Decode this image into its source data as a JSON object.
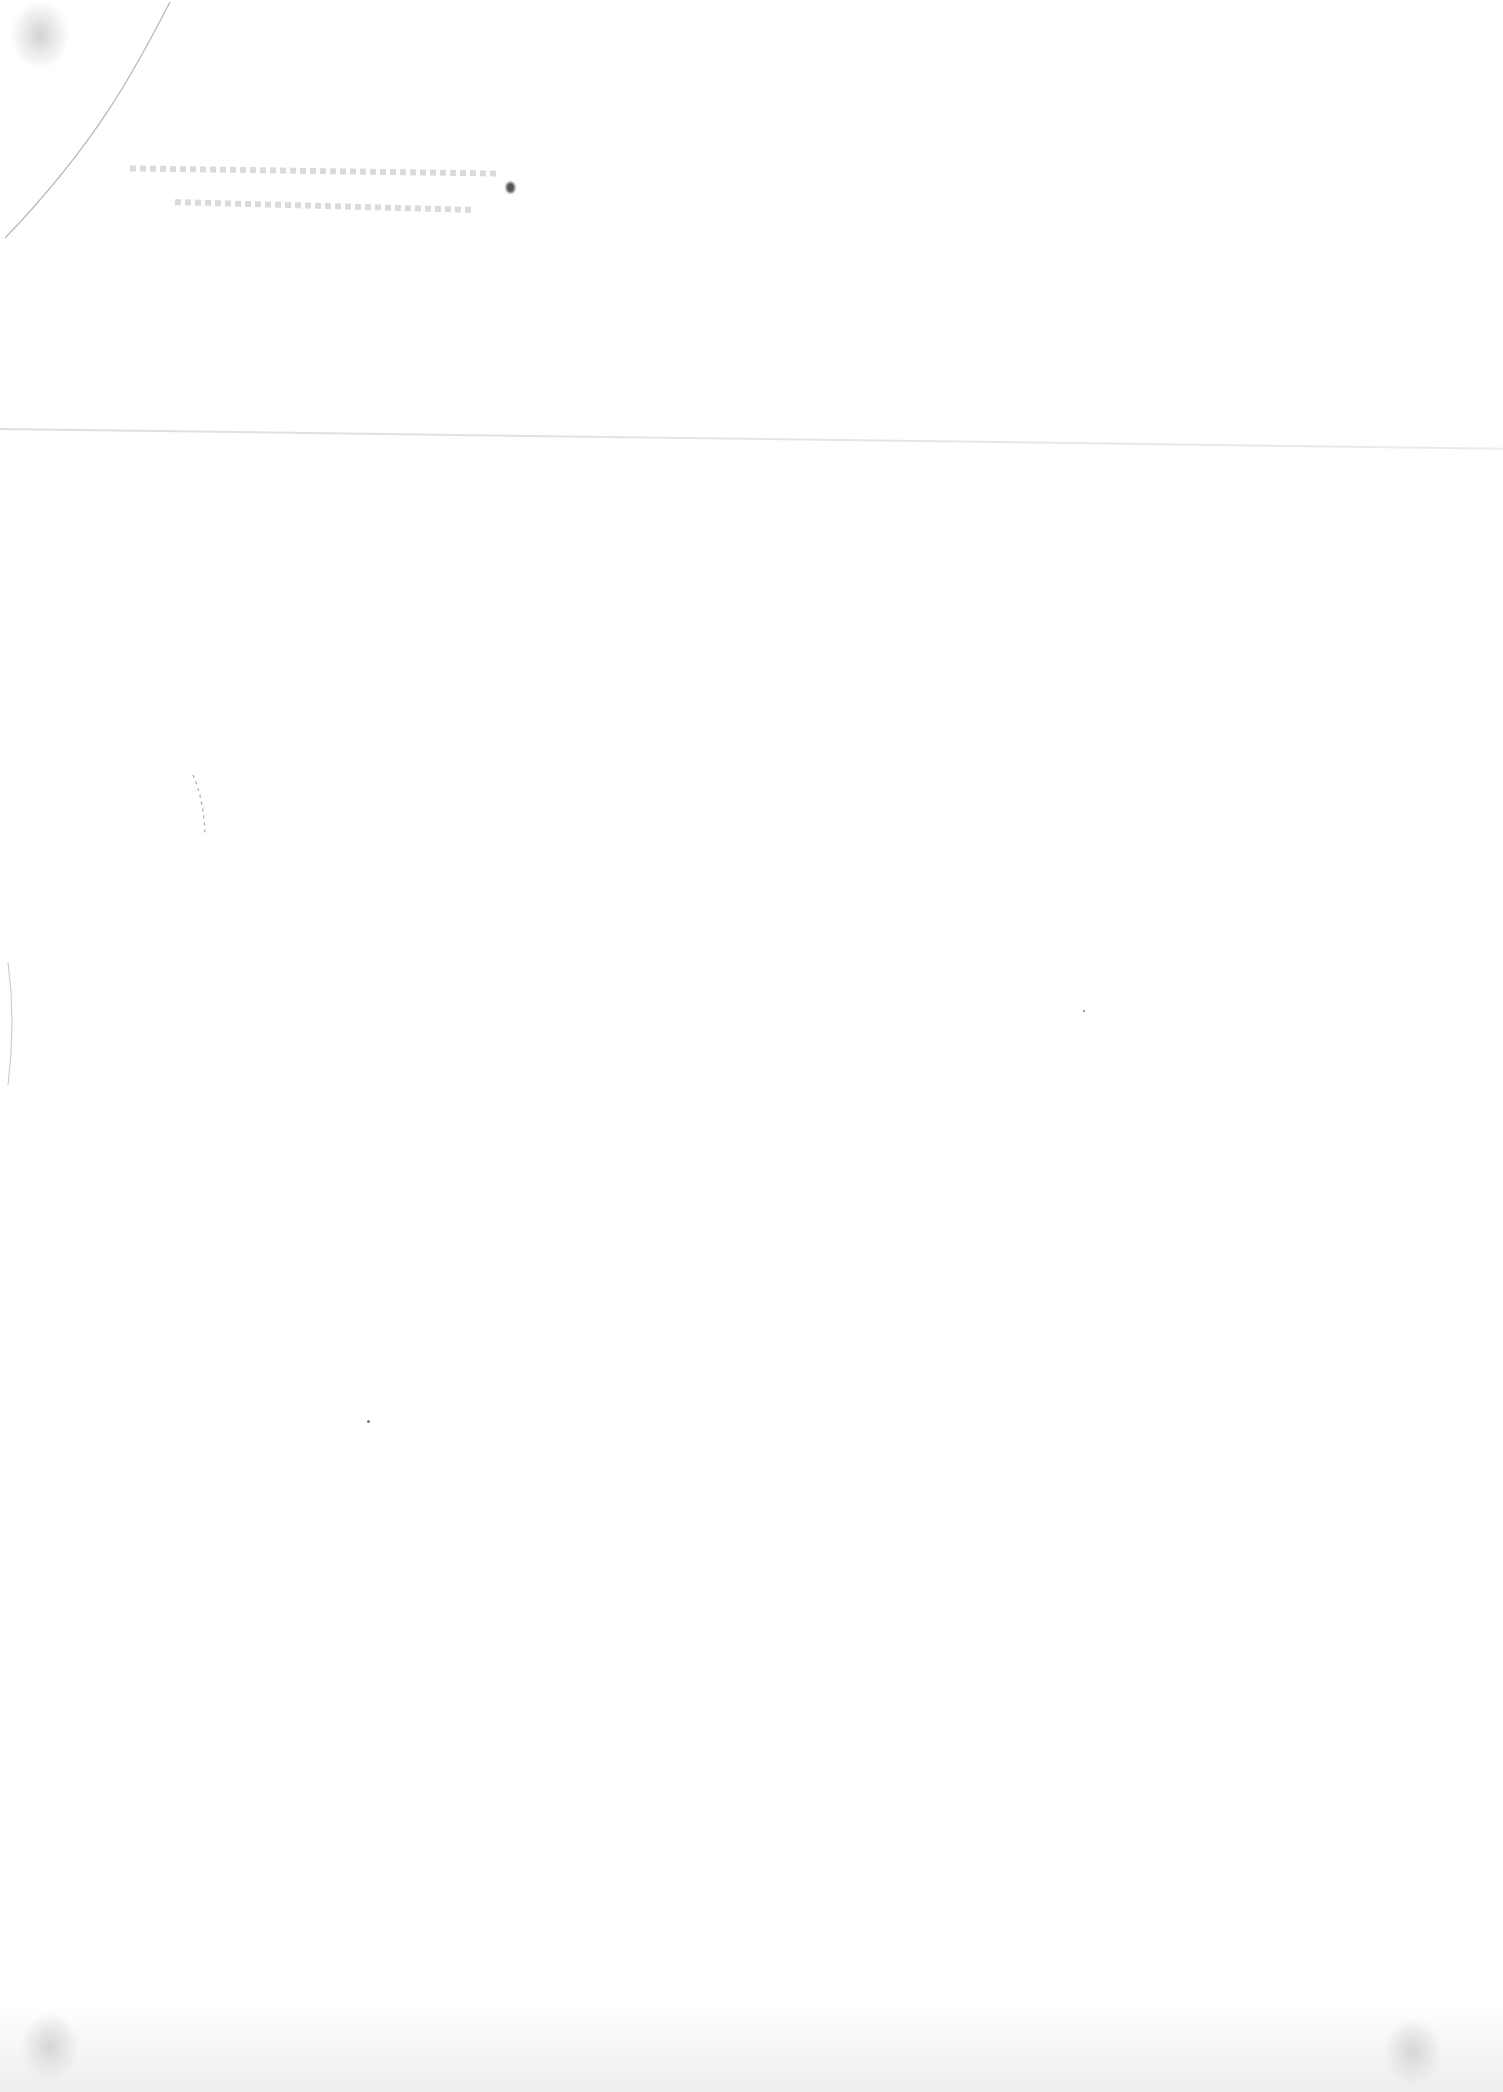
{
  "document": {
    "type": "scanned-blank-page",
    "legible_text": [],
    "accessibility_note": "Blank scanned page with faint illegible bleed-through text near the top"
  },
  "colors": {
    "paper": "#ffffff",
    "smudge": "#8a8a8a",
    "blot": "#555555"
  }
}
